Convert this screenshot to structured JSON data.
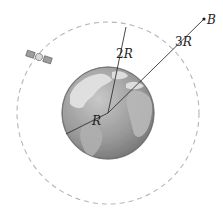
{
  "figure": {
    "labels": {
      "earth_radius": "R",
      "orbit_radius_num": "2",
      "orbit_radius_var": "R",
      "point_b_distance_num": "3",
      "point_b_distance_var": "R",
      "point_b": "B"
    },
    "colors": {
      "orbit": "#b5b5b5",
      "lines": "#333333",
      "earth_ocean": "#9a9a9a",
      "earth_land": "#e6e6e6"
    }
  }
}
